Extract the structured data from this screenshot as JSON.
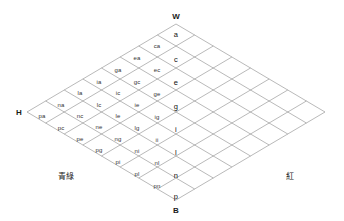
{
  "diagram": {
    "grid": {
      "size": 8,
      "line_color": "#888888",
      "background": "#ffffff"
    },
    "vertices": [
      {
        "id": "white",
        "label": "W",
        "x": 176,
        "y": 16
      },
      {
        "id": "hue",
        "label": "H",
        "x": 19,
        "y": 112
      },
      {
        "id": "black",
        "label": "B",
        "x": 176,
        "y": 210
      }
    ],
    "corner_labels": [
      {
        "id": "blue-green",
        "label": "青綠",
        "x": 66,
        "y": 175
      },
      {
        "id": "red",
        "label": "紅",
        "x": 290,
        "y": 175
      }
    ],
    "columns": [
      {
        "id": "center",
        "major": true,
        "cells": [
          {
            "label": "a",
            "x": 176,
            "y": 34
          },
          {
            "label": "c",
            "x": 176,
            "y": 59
          },
          {
            "label": "e",
            "x": 176,
            "y": 82
          },
          {
            "label": "g",
            "x": 176,
            "y": 106
          },
          {
            "label": "i",
            "x": 176,
            "y": 129
          },
          {
            "label": "l",
            "x": 176,
            "y": 152
          },
          {
            "label": "n",
            "x": 176,
            "y": 175
          },
          {
            "label": "p",
            "x": 176,
            "y": 196
          }
        ]
      },
      {
        "id": "col-1",
        "major": false,
        "cells": [
          {
            "label": "ca",
            "x": 157,
            "y": 46
          },
          {
            "label": "ec",
            "x": 157,
            "y": 70
          },
          {
            "label": "ge",
            "x": 157,
            "y": 94
          },
          {
            "label": "ig",
            "x": 157,
            "y": 117
          },
          {
            "label": "ii",
            "x": 157,
            "y": 140
          },
          {
            "label": "nl",
            "x": 157,
            "y": 163
          },
          {
            "label": "pn",
            "x": 157,
            "y": 186
          }
        ]
      },
      {
        "id": "col-2",
        "major": false,
        "cells": [
          {
            "label": "ea",
            "x": 137,
            "y": 58
          },
          {
            "label": "gc",
            "x": 137,
            "y": 82
          },
          {
            "label": "ie",
            "x": 137,
            "y": 105
          },
          {
            "label": "lg",
            "x": 137,
            "y": 128
          },
          {
            "label": "ni",
            "x": 137,
            "y": 151
          },
          {
            "label": "pl",
            "x": 137,
            "y": 174
          }
        ]
      },
      {
        "id": "col-3",
        "major": false,
        "cells": [
          {
            "label": "ga",
            "x": 118,
            "y": 70
          },
          {
            "label": "ic",
            "x": 118,
            "y": 93
          },
          {
            "label": "le",
            "x": 118,
            "y": 116
          },
          {
            "label": "ng",
            "x": 118,
            "y": 139
          },
          {
            "label": "pi",
            "x": 118,
            "y": 162
          }
        ]
      },
      {
        "id": "col-4",
        "major": false,
        "cells": [
          {
            "label": "ia",
            "x": 99,
            "y": 82
          },
          {
            "label": "lc",
            "x": 99,
            "y": 105
          },
          {
            "label": "ne",
            "x": 99,
            "y": 127
          },
          {
            "label": "pg",
            "x": 99,
            "y": 150
          }
        ]
      },
      {
        "id": "col-5",
        "major": false,
        "cells": [
          {
            "label": "la",
            "x": 80,
            "y": 93
          },
          {
            "label": "nc",
            "x": 80,
            "y": 116
          },
          {
            "label": "pe",
            "x": 80,
            "y": 139
          }
        ]
      },
      {
        "id": "col-6",
        "major": false,
        "cells": [
          {
            "label": "na",
            "x": 61,
            "y": 105
          },
          {
            "label": "pc",
            "x": 61,
            "y": 128
          }
        ]
      },
      {
        "id": "col-7",
        "major": false,
        "cells": [
          {
            "label": "pa",
            "x": 42,
            "y": 116
          }
        ]
      }
    ]
  }
}
